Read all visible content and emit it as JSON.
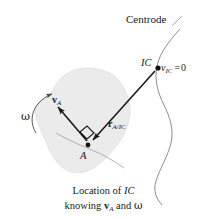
{
  "figure": {
    "title_visible": false,
    "background": "#ffffff",
    "width": 207,
    "height": 219
  },
  "labels": {
    "centrode": "Centrode",
    "ic": "IC",
    "vic_symbol": "v",
    "vic_subscript": "IC",
    "vic_equals": "=",
    "vic_value": "0",
    "va_symbol": "v",
    "va_subscript": "A",
    "r_symbol": "r",
    "r_subscript": "A/IC",
    "point_a": "A",
    "omega": "ω"
  },
  "caption": {
    "line1_prefix": "Location of ",
    "line1_italic": "IC",
    "line2_prefix": "knowing ",
    "line2_vector": "v",
    "line2_vector_sub": "A",
    "line2_conj": " and ",
    "line2_omega": "ω"
  },
  "colors": {
    "body_fill": "#ebebeb",
    "body_stroke": "#d8d8d8",
    "ink": "#1a1a1a",
    "curve": "#7a7a7a",
    "leader": "#9a9a9a",
    "background": "#ffffff"
  },
  "geometry": {
    "point_a": [
      88,
      145
    ],
    "point_ic": [
      158,
      68
    ],
    "va_tip": [
      57,
      105
    ],
    "omega_arc_center": [
      45,
      118
    ]
  }
}
